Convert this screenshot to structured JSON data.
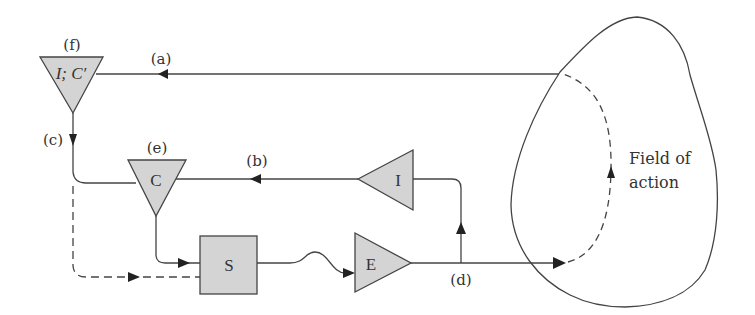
{
  "diagram": {
    "colors": {
      "stroke": "#444444",
      "fill": "#d4d4d4",
      "text": "#333333"
    },
    "nodes": {
      "f": {
        "label": "(f)",
        "text": "I; C′",
        "shape": "triangle-down"
      },
      "e": {
        "label": "(e)",
        "text": "C",
        "shape": "triangle-down"
      },
      "i": {
        "text": "I",
        "shape": "triangle-left"
      },
      "s": {
        "text": "S",
        "shape": "square"
      },
      "e_effector": {
        "text": "E",
        "shape": "triangle-right"
      }
    },
    "edge_labels": {
      "a": "(a)",
      "b": "(b)",
      "c": "(c)",
      "d": "(d)"
    },
    "field": {
      "line1": "Field of",
      "line2": "action"
    }
  }
}
